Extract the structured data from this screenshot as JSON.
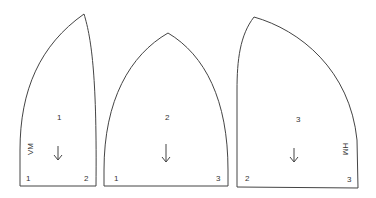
{
  "pieces": [
    {
      "id": "piece-1",
      "center_label": "1",
      "side_label": "VM",
      "corner_left": "1",
      "corner_right": "2",
      "grainline": "arrow-down"
    },
    {
      "id": "piece-2",
      "center_label": "2",
      "corner_left": "1",
      "corner_right": "3",
      "grainline": "arrow-down"
    },
    {
      "id": "piece-3",
      "center_label": "3",
      "side_label": "HM",
      "corner_left": "2",
      "corner_right": "3",
      "grainline": "arrow-down"
    }
  ],
  "colors": {
    "line": "#444444",
    "text": "#333333",
    "background": "#ffffff"
  }
}
